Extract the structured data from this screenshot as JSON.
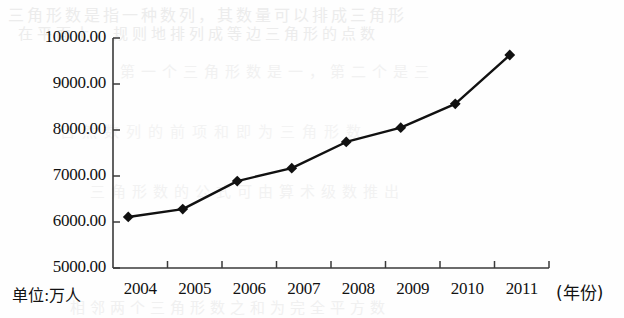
{
  "chart_data": {
    "type": "line",
    "title": "",
    "xlabel": "(年份)",
    "ylabel": "单位:万人",
    "categories": [
      "2004",
      "2005",
      "2006",
      "2007",
      "2008",
      "2009",
      "2010",
      "2011"
    ],
    "values": [
      6110,
      6280,
      6890,
      7170,
      7740,
      8050,
      8570,
      9630
    ],
    "series": [
      {
        "name": "",
        "values": [
          6110,
          6280,
          6890,
          7170,
          7740,
          8050,
          8570,
          9630
        ]
      }
    ],
    "ylim": [
      5000,
      10000
    ],
    "ytick_step": 1000,
    "ytick_labels": [
      "10000.00",
      "9000.00",
      "8000.00",
      "7000.00",
      "6000.00",
      "5000.00"
    ],
    "ytick_values": [
      10000,
      9000,
      8000,
      7000,
      6000,
      5000
    ],
    "grid": false,
    "legend": "none",
    "marker": "diamond",
    "line_color": "#111111",
    "marker_color": "#111111",
    "axis_color": "#3a3a3a"
  },
  "axis": {
    "y_unit_caption": "单位:万人",
    "x_axis_caption": "(年份)"
  },
  "bleed_through": {
    "line1": "三角形数是指一种数列，其数量可以排成三角形",
    "line2": "在平面上，规则地排列成等边三角形的点数",
    "line3": "第一个三角形数是一，第二个是三",
    "line4": "自然数列的前项和即为三角形数",
    "line5": "三角形数的公式可由算术级数推出",
    "line6": "相邻两个三角形数之和为完全平方数"
  }
}
